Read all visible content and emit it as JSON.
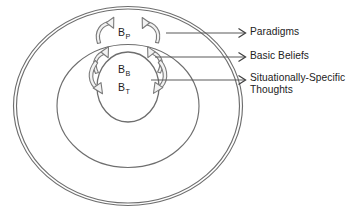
{
  "diagram": {
    "stroke_color": "#6e6e6e",
    "text_color": "#222222",
    "background": "#ffffff",
    "rings": [
      {
        "id": "paradigms",
        "symbol_base": "B",
        "symbol_sub": "P",
        "callout": "Paradigms",
        "level": 1
      },
      {
        "id": "basic-beliefs",
        "symbol_base": "B",
        "symbol_sub": "B",
        "callout": "Basic Beliefs",
        "level": 2
      },
      {
        "id": "situationally-specific-thoughts",
        "symbol_base": "B",
        "symbol_sub": "T",
        "callout": "Situationally-Specific\nThoughts",
        "level": 3
      }
    ],
    "callouts": {
      "paradigms": "Paradigms",
      "basic_beliefs": "Basic Beliefs",
      "situational": "Situationally-Specific\nThoughts"
    },
    "symbols": {
      "paradigms_base": "B",
      "paradigms_sub": "P",
      "basic_base": "B",
      "basic_sub": "B",
      "thoughts_base": "B",
      "thoughts_sub": "T"
    }
  }
}
